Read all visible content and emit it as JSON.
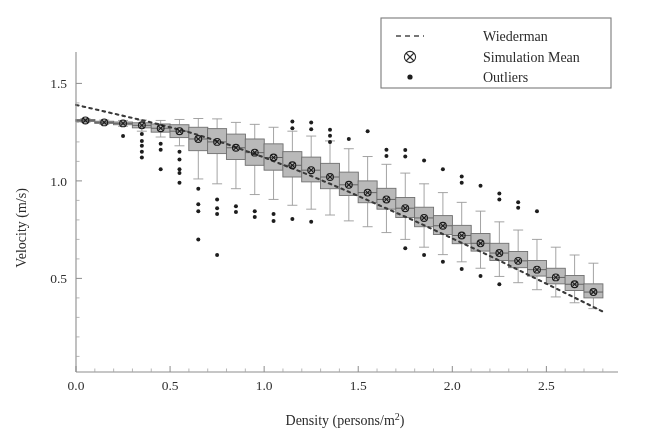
{
  "chart_data": {
    "type": "box",
    "title": "",
    "xlabel": "Density (persons/m²)",
    "ylabel": "Velocity (m/s)",
    "xlim": [
      0.0,
      2.87
    ],
    "ylim": [
      0.02,
      1.62
    ],
    "xticks": [
      0.0,
      0.5,
      1.0,
      1.5,
      2.0,
      2.5
    ],
    "xticklabels": [
      "0.0",
      "0.5",
      "1.0",
      "1.5",
      "2.0",
      "2.5"
    ],
    "yticks": [
      0.5,
      1.0,
      1.5
    ],
    "yticklabels": [
      "0.5",
      "1.0",
      "1.5"
    ],
    "grid": false,
    "legend_position": "top-right",
    "legend": [
      {
        "label": "Wiederman",
        "marker": "dashed-line"
      },
      {
        "label": "Simulation Mean",
        "marker": "circle-x"
      },
      {
        "label": "Outliers",
        "marker": "dot"
      }
    ],
    "series": [
      {
        "name": "Wiederman",
        "type": "line",
        "style": "dotted",
        "x": [
          0.0,
          0.2,
          0.4,
          0.6,
          0.8,
          1.0,
          1.2,
          1.4,
          1.6,
          1.8,
          2.0,
          2.2,
          2.4,
          2.6,
          2.8
        ],
        "y": [
          1.39,
          1.345,
          1.3,
          1.25,
          1.19,
          1.12,
          1.045,
          0.965,
          0.88,
          0.795,
          0.705,
          0.615,
          0.52,
          0.425,
          0.33
        ]
      },
      {
        "name": "Simulation Mean",
        "type": "marker",
        "marker": "circle-x",
        "x": [
          0.05,
          0.15,
          0.25,
          0.35,
          0.45,
          0.55,
          0.65,
          0.75,
          0.85,
          0.95,
          1.05,
          1.15,
          1.25,
          1.35,
          1.45,
          1.55,
          1.65,
          1.75,
          1.85,
          1.95,
          2.05,
          2.15,
          2.25,
          2.35,
          2.45,
          2.55,
          2.65,
          2.75
        ],
        "y": [
          1.31,
          1.3,
          1.295,
          1.285,
          1.27,
          1.255,
          1.215,
          1.2,
          1.17,
          1.145,
          1.12,
          1.08,
          1.055,
          1.02,
          0.98,
          0.94,
          0.905,
          0.86,
          0.81,
          0.77,
          0.72,
          0.68,
          0.63,
          0.59,
          0.545,
          0.505,
          0.47,
          0.43
        ]
      }
    ],
    "boxes": [
      {
        "x": 0.05,
        "q1": 1.305,
        "median": 1.31,
        "q3": 1.315,
        "whisker_low": 1.3,
        "whisker_high": 1.32,
        "outliers": []
      },
      {
        "x": 0.15,
        "q1": 1.295,
        "median": 1.3,
        "q3": 1.306,
        "whisker_low": 1.29,
        "whisker_high": 1.312,
        "outliers": []
      },
      {
        "x": 0.25,
        "q1": 1.288,
        "median": 1.295,
        "q3": 1.302,
        "whisker_low": 1.28,
        "whisker_high": 1.31,
        "outliers": [
          1.23
        ]
      },
      {
        "x": 0.35,
        "q1": 1.272,
        "median": 1.285,
        "q3": 1.298,
        "whisker_low": 1.255,
        "whisker_high": 1.312,
        "outliers": [
          1.24,
          1.205,
          1.18,
          1.15,
          1.12
        ]
      },
      {
        "x": 0.45,
        "q1": 1.25,
        "median": 1.27,
        "q3": 1.292,
        "whisker_low": 1.225,
        "whisker_high": 1.31,
        "outliers": [
          1.19,
          1.16,
          1.06
        ]
      },
      {
        "x": 0.55,
        "q1": 1.222,
        "median": 1.255,
        "q3": 1.288,
        "whisker_low": 1.18,
        "whisker_high": 1.315,
        "outliers": [
          1.15,
          1.11,
          1.06,
          1.04,
          0.99
        ]
      },
      {
        "x": 0.65,
        "q1": 1.155,
        "median": 1.215,
        "q3": 1.275,
        "whisker_low": 1.01,
        "whisker_high": 1.32,
        "outliers": [
          0.96,
          0.88,
          0.845,
          0.7
        ]
      },
      {
        "x": 0.75,
        "q1": 1.14,
        "median": 1.2,
        "q3": 1.268,
        "whisker_low": 0.985,
        "whisker_high": 1.318,
        "outliers": [
          0.905,
          0.86,
          0.83,
          0.62
        ]
      },
      {
        "x": 0.85,
        "q1": 1.11,
        "median": 1.17,
        "q3": 1.24,
        "whisker_low": 0.96,
        "whisker_high": 1.3,
        "outliers": [
          0.87,
          0.84
        ]
      },
      {
        "x": 0.95,
        "q1": 1.08,
        "median": 1.145,
        "q3": 1.215,
        "whisker_low": 0.93,
        "whisker_high": 1.29,
        "outliers": [
          0.845,
          0.815
        ]
      },
      {
        "x": 1.05,
        "q1": 1.055,
        "median": 1.12,
        "q3": 1.19,
        "whisker_low": 0.905,
        "whisker_high": 1.275,
        "outliers": [
          0.83,
          0.795
        ]
      },
      {
        "x": 1.15,
        "q1": 1.02,
        "median": 1.08,
        "q3": 1.15,
        "whisker_low": 0.875,
        "whisker_high": 1.255,
        "outliers": [
          1.305,
          1.27,
          0.805
        ]
      },
      {
        "x": 1.25,
        "q1": 0.995,
        "median": 1.055,
        "q3": 1.122,
        "whisker_low": 0.855,
        "whisker_high": 1.23,
        "outliers": [
          1.3,
          1.265,
          0.79
        ]
      },
      {
        "x": 1.35,
        "q1": 0.96,
        "median": 1.02,
        "q3": 1.09,
        "whisker_low": 0.825,
        "whisker_high": 1.205,
        "outliers": [
          1.262,
          1.232,
          1.2
        ]
      },
      {
        "x": 1.45,
        "q1": 0.925,
        "median": 0.98,
        "q3": 1.045,
        "whisker_low": 0.795,
        "whisker_high": 1.165,
        "outliers": [
          1.215
        ]
      },
      {
        "x": 1.55,
        "q1": 0.888,
        "median": 0.94,
        "q3": 1.0,
        "whisker_low": 0.765,
        "whisker_high": 1.125,
        "outliers": [
          1.255
        ]
      },
      {
        "x": 1.65,
        "q1": 0.855,
        "median": 0.905,
        "q3": 0.962,
        "whisker_low": 0.735,
        "whisker_high": 1.085,
        "outliers": [
          1.16,
          1.128
        ]
      },
      {
        "x": 1.75,
        "q1": 0.812,
        "median": 0.86,
        "q3": 0.915,
        "whisker_low": 0.7,
        "whisker_high": 1.04,
        "outliers": [
          1.158,
          1.125,
          0.655
        ]
      },
      {
        "x": 1.85,
        "q1": 0.765,
        "median": 0.81,
        "q3": 0.865,
        "whisker_low": 0.66,
        "whisker_high": 0.985,
        "outliers": [
          1.105,
          0.62
        ]
      },
      {
        "x": 1.95,
        "q1": 0.725,
        "median": 0.77,
        "q3": 0.822,
        "whisker_low": 0.622,
        "whisker_high": 0.94,
        "outliers": [
          1.06,
          0.585
        ]
      },
      {
        "x": 2.05,
        "q1": 0.678,
        "median": 0.72,
        "q3": 0.772,
        "whisker_low": 0.585,
        "whisker_high": 0.89,
        "outliers": [
          1.022,
          0.99,
          0.548
        ]
      },
      {
        "x": 2.15,
        "q1": 0.64,
        "median": 0.68,
        "q3": 0.73,
        "whisker_low": 0.552,
        "whisker_high": 0.845,
        "outliers": [
          0.975,
          0.512
        ]
      },
      {
        "x": 2.25,
        "q1": 0.592,
        "median": 0.63,
        "q3": 0.68,
        "whisker_low": 0.51,
        "whisker_high": 0.79,
        "outliers": [
          0.935,
          0.905,
          0.47
        ]
      },
      {
        "x": 2.35,
        "q1": 0.555,
        "median": 0.59,
        "q3": 0.638,
        "whisker_low": 0.478,
        "whisker_high": 0.748,
        "outliers": [
          0.89,
          0.862
        ]
      },
      {
        "x": 2.45,
        "q1": 0.512,
        "median": 0.545,
        "q3": 0.592,
        "whisker_low": 0.442,
        "whisker_high": 0.7,
        "outliers": [
          0.845
        ]
      },
      {
        "x": 2.55,
        "q1": 0.472,
        "median": 0.505,
        "q3": 0.552,
        "whisker_low": 0.405,
        "whisker_high": 0.66,
        "outliers": []
      },
      {
        "x": 2.65,
        "q1": 0.438,
        "median": 0.47,
        "q3": 0.515,
        "whisker_low": 0.375,
        "whisker_high": 0.62,
        "outliers": []
      },
      {
        "x": 2.75,
        "q1": 0.4,
        "median": 0.43,
        "q3": 0.472,
        "whisker_low": 0.345,
        "whisker_high": 0.578,
        "outliers": []
      }
    ]
  }
}
